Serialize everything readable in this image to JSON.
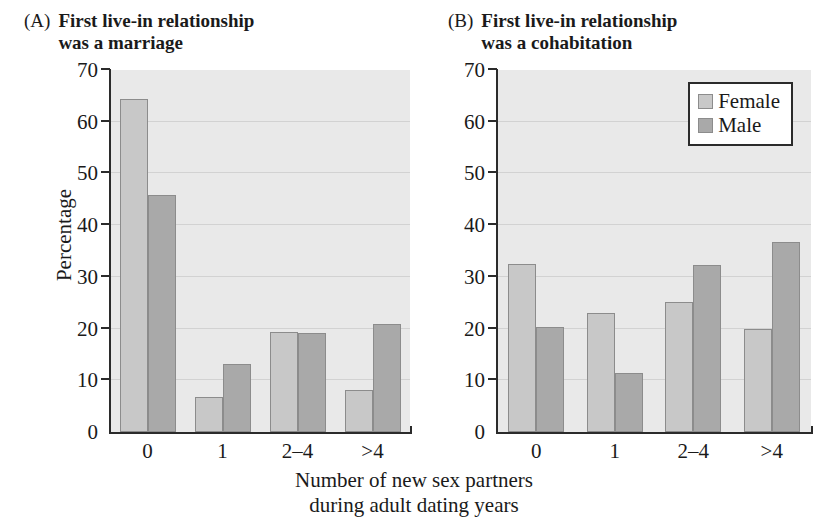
{
  "figure": {
    "xaxis_caption": "Number of new sex partners\nduring adult dating years",
    "legend": {
      "female_label": "Female",
      "male_label": "Male"
    },
    "colors": {
      "female": "#c8c8c8",
      "male": "#a9a9a9",
      "plot_background": "#e9e9e9",
      "gridline": "#d2d2d2",
      "axis": "#2b2b2b"
    }
  },
  "panels": [
    {
      "tag": "(A)",
      "title": "First live-in relationship\nwas a marriage"
    },
    {
      "tag": "(B)",
      "title": "First live-in relationship\nwas a cohabitation"
    }
  ],
  "axes": {
    "ylabel": "Percentage",
    "yticks": [
      "0",
      "10",
      "20",
      "30",
      "40",
      "50",
      "60",
      "70"
    ],
    "xticks": [
      "0",
      "1",
      "2–4",
      ">4"
    ]
  },
  "chart_data": [
    {
      "type": "bar",
      "title": "(A) First live-in relationship was a marriage",
      "categories": [
        "0",
        "1",
        "2–4",
        ">4"
      ],
      "series": [
        {
          "name": "Female",
          "values": [
            64.3,
            6.8,
            19.4,
            8.1
          ]
        },
        {
          "name": "Male",
          "values": [
            45.8,
            13.1,
            19.2,
            20.9
          ]
        }
      ],
      "xlabel": "Number of new sex partners during adult dating years",
      "ylabel": "Percentage",
      "ylim": [
        0,
        70
      ],
      "ytick_step": 10,
      "grid": true,
      "legend_position": "none"
    },
    {
      "type": "bar",
      "title": "(B) First live-in relationship was a cohabitation",
      "categories": [
        "0",
        "1",
        "2–4",
        ">4"
      ],
      "series": [
        {
          "name": "Female",
          "values": [
            32.5,
            23.1,
            25.2,
            19.9
          ]
        },
        {
          "name": "Male",
          "values": [
            20.4,
            11.4,
            32.2,
            36.7
          ]
        }
      ],
      "xlabel": "Number of new sex partners during adult dating years",
      "ylabel": "Percentage",
      "ylim": [
        0,
        70
      ],
      "ytick_step": 10,
      "grid": true,
      "legend_position": "top-right"
    }
  ]
}
